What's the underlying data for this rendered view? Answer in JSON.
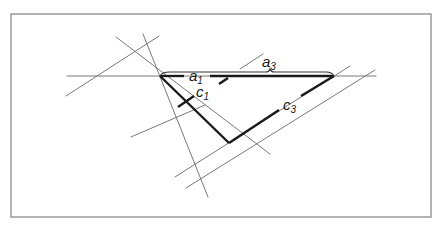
{
  "figure": {
    "width": 444,
    "height": 230,
    "frame": {
      "x": 11,
      "y": 14,
      "w": 420,
      "h": 203
    },
    "vertices": {
      "A": {
        "x": 160,
        "y": 76
      },
      "B": {
        "x": 229,
        "y": 143
      },
      "C": {
        "x": 334,
        "y": 76
      }
    },
    "labels": {
      "a1": {
        "base": "a",
        "sub": "1"
      },
      "a3": {
        "base": "a",
        "sub": "3"
      },
      "c1": {
        "base": "c",
        "sub": "1"
      },
      "c3": {
        "base": "c",
        "sub": "3"
      }
    },
    "colors": {
      "frame": "#8a8a8a",
      "thin_line": "#6a6a6a",
      "thick_line": "#1a1a1a",
      "background": "#ffffff"
    }
  }
}
